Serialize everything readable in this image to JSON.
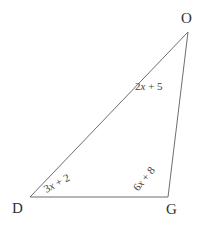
{
  "figure": {
    "type": "triangle-diagram",
    "background_color": "#ffffff",
    "stroke_color": "#6e6e6e",
    "label_color": "#3a3a3a",
    "vertices": [
      {
        "name": "O",
        "label": "O",
        "x": 188,
        "y": 32
      },
      {
        "name": "D",
        "label": "D",
        "x": 30,
        "y": 197
      },
      {
        "name": "G",
        "label": "G",
        "x": 168,
        "y": 197
      }
    ],
    "sides": [
      {
        "name": "side-OG",
        "from": "O",
        "to": "G",
        "label": "2x + 5",
        "label_prefix": "2",
        "label_var": "x",
        "label_suffix": " + 5",
        "rotation_deg": 0
      },
      {
        "name": "side-DO",
        "from": "D",
        "to": "O",
        "label": "3x + 2",
        "label_prefix": "3",
        "label_var": "x",
        "label_suffix": " + 2",
        "rotation_deg": -28
      },
      {
        "name": "side-DG",
        "from": "D",
        "to": "G",
        "label": "6x + 8",
        "label_prefix": "6",
        "label_var": "x",
        "label_suffix": " + 8",
        "rotation_deg": -50
      }
    ]
  }
}
